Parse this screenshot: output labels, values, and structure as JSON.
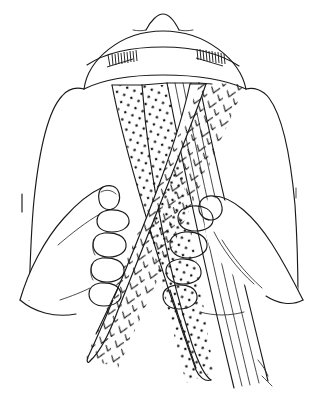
{
  "figure": {
    "background_color": "#ffffff",
    "ink_color": "#1a1a1a",
    "width": 328,
    "height": 406,
    "caption": ""
  },
  "scene": {
    "top_element": {
      "name": "head-top-with-cap",
      "label": "head crown with banded cap",
      "has_center_peak": true,
      "band_stitching_groups": 2
    },
    "shoulders": {
      "left_label": "left shoulder",
      "right_label": "right shoulder"
    },
    "hands": [
      {
        "name": "left-hand",
        "label": "Left hand",
        "grip": "gripping chevron strand",
        "visible_fingers": 4,
        "thumb_visible": true
      },
      {
        "name": "right-hand",
        "label": "Right hand",
        "grip": "gripping dotted and plain strands",
        "visible_fingers": 4,
        "thumb_visible": true
      }
    ],
    "strands": [
      {
        "id": "strand-dotted",
        "name": "dotted-strand",
        "label": "Dotted strand",
        "pattern": "dots",
        "pattern_color": "#111111",
        "path_direction": "from upper-left anchor down to lower-right",
        "held_by": "right-hand"
      },
      {
        "id": "strand-chevron",
        "name": "chevron-strand",
        "label": "Chevron strand",
        "pattern": "chevrons",
        "pattern_color": "#111111",
        "path_direction": "from upper-right anchor down to lower-left",
        "held_by": "left-hand"
      },
      {
        "id": "strand-plain",
        "name": "plain-strand",
        "label": "Plain strand",
        "pattern": "parallel lines",
        "pattern_color": "#2a2a2a",
        "path_direction": "from center anchor straight down to lower-right",
        "held_by": "right-hand"
      }
    ]
  }
}
